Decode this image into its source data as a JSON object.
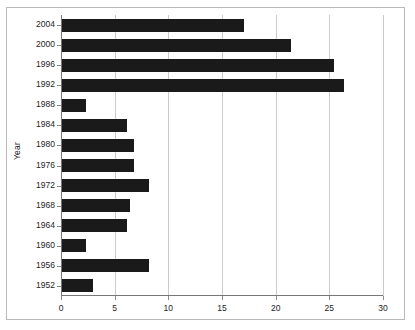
{
  "chart_data": {
    "type": "bar",
    "orientation": "horizontal",
    "title": "",
    "xlabel": "",
    "ylabel": "Year",
    "xlim": [
      0,
      30
    ],
    "ylim": null,
    "grid": true,
    "legend": null,
    "x_ticks": [
      "0",
      "5",
      "10",
      "15",
      "20",
      "25",
      "30"
    ],
    "x_tick_values": [
      0,
      5,
      10,
      15,
      20,
      25,
      30
    ],
    "categories": [
      "2004",
      "2000",
      "1996",
      "1992",
      "1988",
      "1984",
      "1980",
      "1976",
      "1972",
      "1968",
      "1964",
      "1960",
      "1956",
      "1952"
    ],
    "values": [
      17,
      21.3,
      25.3,
      26.3,
      2.2,
      6.1,
      6.7,
      6.7,
      8.1,
      6.3,
      6.1,
      2.2,
      8.1,
      2.9
    ],
    "bar_color": "#1a1a1a",
    "grid_color": "#cccccc",
    "axis_color": "#777777",
    "background_color": "#ffffff"
  }
}
